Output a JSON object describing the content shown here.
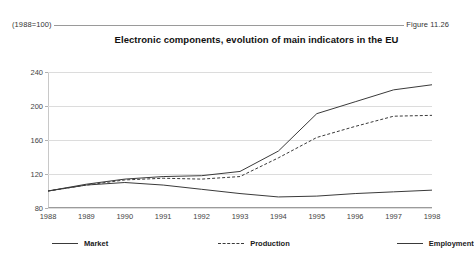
{
  "header": {
    "left_note": "(1988=100)",
    "figure_label": "Figure 11.26"
  },
  "chart_data": {
    "type": "line",
    "title": "Electronic components, evolution of main indicators in the EU",
    "xlabel": "",
    "ylabel": "",
    "index_note": "(1988=100)",
    "x": [
      1988,
      1989,
      1990,
      1991,
      1992,
      1993,
      1994,
      1995,
      1996,
      1997,
      1998
    ],
    "categories": [
      "1988",
      "1989",
      "1990",
      "1991",
      "1992",
      "1993",
      "1994",
      "1995",
      "1996",
      "1997",
      "1998"
    ],
    "ylim": [
      80,
      240
    ],
    "yticks": [
      80,
      120,
      160,
      200,
      240
    ],
    "ytick_labels": [
      "80",
      "120",
      "160",
      "200",
      "240"
    ],
    "grid": true,
    "legend_position": "bottom",
    "series": [
      {
        "name": "Market",
        "style": "solid",
        "color": "#3a3a3a",
        "values": [
          100,
          108,
          114,
          117,
          118,
          123,
          147,
          191,
          205,
          219,
          225
        ]
      },
      {
        "name": "Production",
        "style": "dashed",
        "color": "#3a3a3a",
        "values": [
          100,
          107,
          113,
          115,
          114,
          117,
          139,
          163,
          176,
          188,
          189
        ]
      },
      {
        "name": "Employment",
        "style": "solid",
        "color": "#3a3a3a",
        "values": [
          100,
          107,
          110,
          107,
          102,
          97,
          93,
          94,
          97,
          99,
          101
        ]
      }
    ]
  }
}
